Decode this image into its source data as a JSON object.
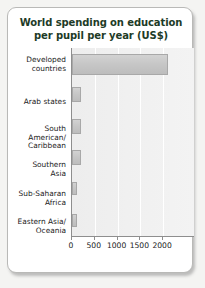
{
  "chart_data": {
    "type": "bar",
    "orientation": "horizontal",
    "title": "World spending on education per pupil per year (US$)",
    "title_line1": "World spending on education",
    "title_line2": "per pupil per year (US$)",
    "xlabel": "",
    "ylabel": "",
    "xlim": [
      0,
      2700
    ],
    "xticks": [
      0,
      500,
      1000,
      1500,
      2000
    ],
    "xtick_labels": [
      "0",
      "500",
      "1000",
      "1500",
      "2000"
    ],
    "grid": true,
    "legend": null,
    "categories": [
      "Developed countries",
      "Arab states",
      "South American/ Caribbean",
      "Southern Asia",
      "Sub-Saharan Africa",
      "Eastern Asia/ Oceania"
    ],
    "category_lines": [
      [
        "Developed",
        "countries"
      ],
      [
        "Arab states"
      ],
      [
        "South",
        "American/",
        "Caribbean"
      ],
      [
        "Southern",
        "Asia"
      ],
      [
        "Sub-Saharan",
        "Africa"
      ],
      [
        "Eastern Asia/",
        "Oceania"
      ]
    ],
    "values": [
      2100,
      200,
      200,
      190,
      120,
      100
    ],
    "colors": {
      "bar_fill": "#c6c6c6",
      "bar_border": "#a8a8a8",
      "plot_background": "#f0f0f0",
      "gridline": "#ffffff",
      "axis": "#8e8e8e",
      "title_text": "#1d3b27",
      "label_text": "#1a1a1a",
      "card_background": "#ffffff",
      "card_border": "#b9b9b7",
      "page_background": "#f4f4f2"
    }
  }
}
